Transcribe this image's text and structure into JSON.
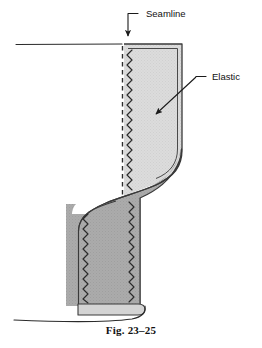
{
  "figure": {
    "caption": "Fig. 23–25",
    "background_color": "#ffffff",
    "width": 262,
    "height": 348
  },
  "labels": [
    {
      "id": "seamline",
      "text": "Seamline",
      "x": 146,
      "y": 15,
      "leader": "short-dash-then-vertical-arrow-down",
      "arrow_target_x": 125,
      "arrow_target_y": 46
    },
    {
      "id": "elastic",
      "text": "Elastic",
      "x": 212,
      "y": 79,
      "leader": "short-dash-then-diagonal-arrow-down-left",
      "arrow_target_x": 153,
      "arrow_target_y": 117
    }
  ],
  "colors": {
    "outline": "#2b2b2b",
    "elastic_fill": "#d9d9d9",
    "flap_fill": "#a9a9a9",
    "band_fill": "#d0d0d0",
    "stitch": "#2b2b2b",
    "seamline_dash": "#2b2b2b",
    "label_text": "#111111",
    "caption_text": "#111111"
  },
  "parts": [
    {
      "id": "garment-edge-top",
      "name": "upper horizontal fabric edge",
      "description": "horizontal line running left from the elastic panel top"
    },
    {
      "id": "elastic-panel",
      "name": "elastic",
      "fill": "light-gray",
      "description": "vertical light gray panel with rounded lower-right corner"
    },
    {
      "id": "seamline-dashes",
      "name": "seamline",
      "description": "vertical dashed line at left of elastic panel"
    },
    {
      "id": "zigzag-elastic-left",
      "name": "zigzag stitching",
      "description": "zigzag stitch line along left inner edge of elastic"
    },
    {
      "id": "folded-flap",
      "name": "folded fabric flap",
      "fill": "medium-gray",
      "description": "darker gray fabric folded down in an S-curve"
    },
    {
      "id": "zigzag-flap-left",
      "name": "zigzag stitching",
      "description": "zigzag stitch along left edge of flap"
    },
    {
      "id": "zigzag-flap-right",
      "name": "zigzag stitching",
      "description": "zigzag stitch along right edge of flap"
    },
    {
      "id": "hem-band",
      "name": "hem band",
      "fill": "pale-gray",
      "description": "light band across bottom of flap"
    },
    {
      "id": "garment-edge-bottom",
      "name": "lower fabric edge",
      "description": "curving line running left from bottom of flap"
    }
  ]
}
